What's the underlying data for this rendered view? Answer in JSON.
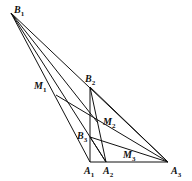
{
  "diagram": {
    "stroke": "#111111",
    "points": {
      "B1": [
        11,
        13
      ],
      "B2": [
        90,
        87
      ],
      "B3": [
        90,
        137
      ],
      "A1": [
        90,
        162
      ],
      "A2": [
        106,
        162
      ],
      "A3": [
        168,
        162
      ],
      "M1": [
        56,
        95
      ],
      "M2": [
        98,
        123
      ],
      "M3": [
        133,
        152
      ]
    },
    "segments": [
      [
        "B1",
        "A1"
      ],
      [
        "B1",
        "A2"
      ],
      [
        "B1",
        "A3"
      ],
      [
        "A1",
        "A3"
      ],
      [
        "A1",
        "B2"
      ],
      [
        "B2",
        "A2"
      ],
      [
        "B2",
        "A3"
      ],
      [
        "B3",
        "A3"
      ],
      [
        "B1",
        "M2"
      ],
      [
        "B3",
        "A2"
      ],
      [
        "M1",
        "A3"
      ]
    ],
    "labels": [
      {
        "id": "B1",
        "main": "B",
        "sub": "1",
        "x": 14,
        "y": 5
      },
      {
        "id": "B2",
        "main": "B",
        "sub": "2",
        "x": 85,
        "y": 74
      },
      {
        "id": "B3",
        "main": "B",
        "sub": "3",
        "x": 77,
        "y": 131
      },
      {
        "id": "M1",
        "main": "M",
        "sub": "1",
        "x": 34,
        "y": 81
      },
      {
        "id": "M2",
        "main": "M",
        "sub": "2",
        "x": 103,
        "y": 117
      },
      {
        "id": "M3",
        "main": "M",
        "sub": "3",
        "x": 123,
        "y": 150
      },
      {
        "id": "A1",
        "main": "A",
        "sub": "1",
        "x": 84,
        "y": 166
      },
      {
        "id": "A2",
        "main": "A",
        "sub": "2",
        "x": 103,
        "y": 166
      },
      {
        "id": "A3",
        "main": "A",
        "sub": "3",
        "x": 171,
        "y": 166
      }
    ]
  }
}
